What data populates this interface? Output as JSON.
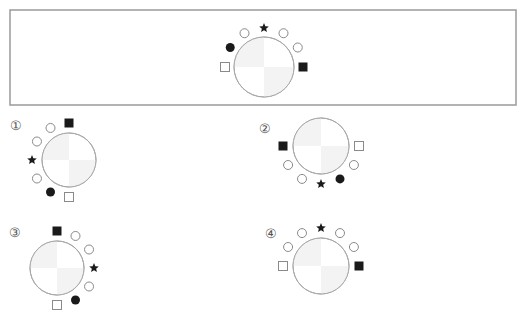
{
  "question": {
    "figure": {
      "name": "question-figure",
      "symbols": [
        "hollow-square",
        "filled-circle",
        "hollow-circle",
        "star",
        "hollow-circle",
        "hollow-circle",
        "filled-square"
      ],
      "angles_deg": [
        -90,
        -60,
        -30,
        0,
        30,
        60,
        90
      ]
    }
  },
  "options": [
    {
      "label": "①",
      "symbols": [
        "filled-square",
        "hollow-circle",
        "hollow-circle",
        "star",
        "hollow-circle",
        "filled-circle",
        "hollow-square"
      ],
      "angles_deg": [
        0,
        -30,
        -60,
        -90,
        -120,
        -150,
        180
      ]
    },
    {
      "label": "②",
      "symbols": [
        "filled-square",
        "hollow-circle",
        "hollow-circle",
        "star",
        "filled-circle",
        "hollow-circle",
        "hollow-square"
      ],
      "angles_deg": [
        -90,
        -120,
        -150,
        180,
        150,
        120,
        90
      ]
    },
    {
      "label": "③",
      "symbols": [
        "filled-square",
        "hollow-circle",
        "hollow-circle",
        "star",
        "hollow-circle",
        "filled-circle",
        "hollow-square"
      ],
      "angles_deg": [
        0,
        30,
        60,
        90,
        120,
        150,
        180
      ]
    },
    {
      "label": "④",
      "symbols": [
        "hollow-square",
        "hollow-circle",
        "hollow-circle",
        "star",
        "hollow-circle",
        "hollow-circle",
        "filled-square"
      ],
      "angles_deg": [
        -90,
        -60,
        -30,
        0,
        30,
        60,
        90
      ]
    }
  ]
}
